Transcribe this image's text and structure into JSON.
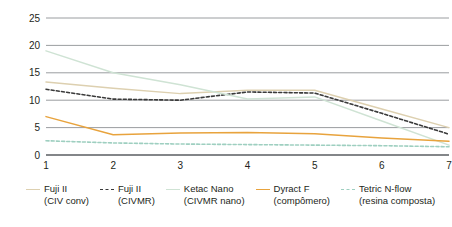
{
  "chart_data": {
    "type": "line",
    "title": "",
    "subtitle": "",
    "xlabel": "",
    "ylabel": "",
    "categories": [
      "1",
      "2",
      "3",
      "4",
      "5",
      "6",
      "7"
    ],
    "x": [
      1,
      2,
      3,
      4,
      5,
      6,
      7
    ],
    "ylim": [
      0,
      25
    ],
    "xlim": [
      1,
      7
    ],
    "yticks": [
      0,
      5,
      10,
      15,
      20,
      25
    ],
    "ytick_labels": [
      "0",
      "5",
      "10",
      "15",
      "20",
      "25"
    ],
    "xtick_labels": [
      "1",
      "2",
      "3",
      "4",
      "5",
      "6",
      "7"
    ],
    "grid": "horizontal",
    "legend_position": "bottom",
    "series": [
      {
        "name": "Fuji II (CIV conv)",
        "label_line1": "Fuji II",
        "label_line2": "(CIV conv)",
        "color": "#ddd0b0",
        "style": "solid",
        "values": [
          13.3,
          12.2,
          11.2,
          11.8,
          11.8,
          8.4,
          5.0
        ]
      },
      {
        "name": "Fuji II (CIVMR)",
        "label_line1": "Fuji II",
        "label_line2": "(CIVMR)",
        "color": "#3a3a3a",
        "style": "dashed",
        "values": [
          12.0,
          10.2,
          10.0,
          11.5,
          11.3,
          7.6,
          3.8
        ]
      },
      {
        "name": "Ketac Nano (CIVMR nano)",
        "label_line1": "Ketac Nano",
        "label_line2": "(CIVMR nano)",
        "color": "#cfe3d4",
        "style": "solid",
        "values": [
          19.0,
          15.0,
          12.8,
          10.2,
          10.6,
          6.2,
          1.8
        ]
      },
      {
        "name": "Dyract F (compômero)",
        "label_line1": "Dyract F",
        "label_line2": "(compômero)",
        "color": "#e8a33d",
        "style": "solid",
        "values": [
          7.0,
          3.7,
          4.0,
          4.1,
          3.9,
          3.1,
          2.5
        ]
      },
      {
        "name": "Tetric N-flow (resina composta)",
        "label_line1": "Tetric N-flow",
        "label_line2": "(resina composta)",
        "color": "#9ecfc0",
        "style": "dashed",
        "values": [
          2.6,
          2.2,
          2.0,
          1.9,
          1.8,
          1.7,
          1.5
        ]
      }
    ]
  }
}
